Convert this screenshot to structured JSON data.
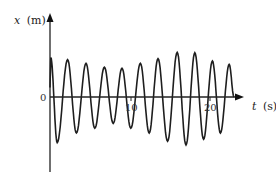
{
  "chart_data": {
    "type": "line",
    "title": "",
    "xlabel": "t (s)",
    "ylabel": "x (m)",
    "x_axis": {
      "label_var": "t",
      "label_unit": "(s)",
      "ticks": [
        10,
        20
      ],
      "range": [
        0,
        23.5
      ]
    },
    "y_axis": {
      "label_var": "x",
      "label_unit": "(m)",
      "ticks": [
        0
      ],
      "scale": "unlabeled"
    },
    "origin_label": "0",
    "grid": false,
    "legend": null,
    "series": [
      {
        "name": "x(t)",
        "points_t": [
          0.1,
          0.9,
          2.2,
          3.3,
          4.5,
          5.6,
          6.8,
          7.9,
          9.0,
          10.1,
          11.3,
          12.4,
          13.5,
          14.7,
          15.9,
          17.0,
          18.1,
          19.2,
          20.3,
          21.3,
          22.4,
          23.0
        ],
        "points_x": [
          0.82,
          -0.95,
          0.78,
          -0.75,
          0.7,
          -0.65,
          0.62,
          -0.55,
          0.6,
          -0.65,
          0.7,
          -0.75,
          0.8,
          -0.92,
          0.93,
          -1.0,
          0.92,
          -0.88,
          0.75,
          -0.75,
          0.68,
          0.0
        ],
        "color": "#222222"
      }
    ]
  },
  "labels": {
    "y_var": "x",
    "y_unit": "(m)",
    "x_var": "t",
    "x_unit": "(s)",
    "origin": "0",
    "tick_10": "10",
    "tick_20": "20"
  }
}
